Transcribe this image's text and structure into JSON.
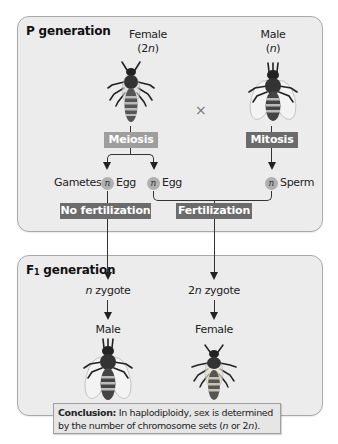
{
  "p_generation": {
    "title": "P generation",
    "female": {
      "label": "Female",
      "ploidy_prefix": "(2",
      "ploidy_var": "n",
      "ploidy_suffix": ")",
      "icon": "bee-female-icon"
    },
    "male": {
      "label": "Male",
      "ploidy_prefix": "(",
      "ploidy_var": "n",
      "ploidy_suffix": ")",
      "icon": "bee-male-icon"
    },
    "cross_symbol": "×",
    "processes": {
      "female": "Meiosis",
      "male": "Mitosis"
    },
    "gametes": {
      "label": "Gametes",
      "badge": "n",
      "egg1": "Egg",
      "egg2": "Egg",
      "sperm": "Sperm"
    },
    "outcomes": {
      "left": "No fertilization",
      "right": "Fertilization"
    }
  },
  "f1_generation": {
    "title_prefix": "F",
    "title_sub": "1",
    "title_suffix": " generation",
    "left": {
      "zygote_var": "n",
      "zygote_text": " zygote",
      "sex": "Male",
      "icon": "bee-male-icon"
    },
    "right": {
      "zygote_num": "2",
      "zygote_var": "n",
      "zygote_text": " zygote",
      "sex": "Female",
      "icon": "bee-female-icon"
    }
  },
  "conclusion": {
    "heading": "Conclusion:",
    "text_1": " In haplodiploidy, sex is determined by the number of chromosome sets (",
    "var_1": "n",
    "text_2": " or 2",
    "var_2": "n",
    "text_3": ")."
  },
  "colors": {
    "panel_bg": "#ececec",
    "meiosis_tag": "#9e9e9e",
    "dark_tag": "#6b6b6b",
    "badge": "#b0b0b0"
  }
}
